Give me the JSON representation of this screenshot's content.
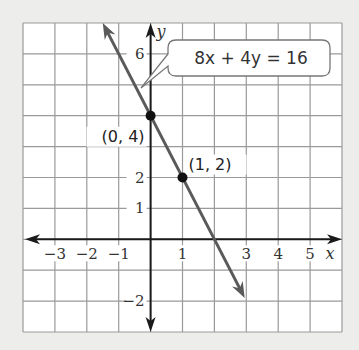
{
  "chart_data": {
    "type": "line",
    "title": "",
    "xlabel": "x",
    "ylabel": "y",
    "xlim": [
      -4,
      6
    ],
    "ylim": [
      -3,
      7
    ],
    "grid": true,
    "x_ticks": [
      {
        "value": -3,
        "label": "−3"
      },
      {
        "value": -2,
        "label": "−2"
      },
      {
        "value": -1,
        "label": "−1"
      },
      {
        "value": 1,
        "label": "1"
      },
      {
        "value": 3,
        "label": "3"
      },
      {
        "value": 4,
        "label": "4"
      },
      {
        "value": 5,
        "label": "5"
      }
    ],
    "y_ticks": [
      {
        "value": 6,
        "label": "6"
      },
      {
        "value": 2,
        "label": "2"
      },
      {
        "value": 1,
        "label": "1"
      },
      {
        "value": -2,
        "label": "−2"
      }
    ],
    "series": [
      {
        "name": "8x + 4y = 16",
        "equation": "y = -2x + 4",
        "slope": -2,
        "intercept": 4,
        "x_range": [
          -1.5,
          2.95
        ],
        "color": "#5a5a5a",
        "arrows": "both"
      }
    ],
    "points": [
      {
        "x": 0,
        "y": 4,
        "label": "(0, 4)"
      },
      {
        "x": 1,
        "y": 2,
        "label": "(1, 2)"
      }
    ],
    "annotations": [
      {
        "text": "8x + 4y = 16",
        "type": "callout",
        "points_to": {
          "x": -0.3,
          "y": 4.9
        }
      }
    ]
  },
  "colors": {
    "background": "#ededeb",
    "grid": "#9a9a9a",
    "axis": "#1a1a1a",
    "line": "#5a5a5a",
    "point": "#111111"
  }
}
